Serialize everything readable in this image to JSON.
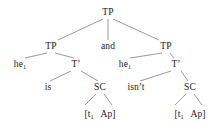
{
  "figure": {
    "kind": "syntax-tree",
    "background_color": "#ffffff",
    "line_color": "#555555",
    "text_color": "#1a1a1a"
  },
  "tree": {
    "root": {
      "label": "TP",
      "x": 108,
      "y": 8
    },
    "conjunction": {
      "label": "and",
      "x": 108,
      "y": 42
    },
    "left_clause": {
      "tp": {
        "label": "TP",
        "x": 51,
        "y": 42
      },
      "subject": {
        "label": "he",
        "subscript": "1",
        "x": 20,
        "y": 60
      },
      "tbar": {
        "label": "T’",
        "x": 76,
        "y": 60
      },
      "aux": {
        "label": "is",
        "x": 48,
        "y": 83
      },
      "sc": {
        "label": "SC",
        "x": 100,
        "y": 83
      },
      "terminal": {
        "open_bracket": "[",
        "trace": "t",
        "trace_subscript": "1",
        "predicate": "Ap",
        "close_bracket": "]",
        "x": 100,
        "y": 110
      }
    },
    "right_clause": {
      "tp": {
        "label": "TP",
        "x": 166,
        "y": 42
      },
      "subject": {
        "label": "he",
        "subscript": "1",
        "x": 125,
        "y": 60
      },
      "tbar": {
        "label": "T’",
        "x": 176,
        "y": 60
      },
      "aux": {
        "label": "isn’t",
        "x": 136,
        "y": 83
      },
      "sc": {
        "label": "SC",
        "x": 190,
        "y": 83
      },
      "terminal": {
        "open_bracket": "[",
        "trace": "t",
        "trace_subscript": "1",
        "predicate": "Ap",
        "close_bracket": "]",
        "x": 190,
        "y": 110
      }
    }
  }
}
